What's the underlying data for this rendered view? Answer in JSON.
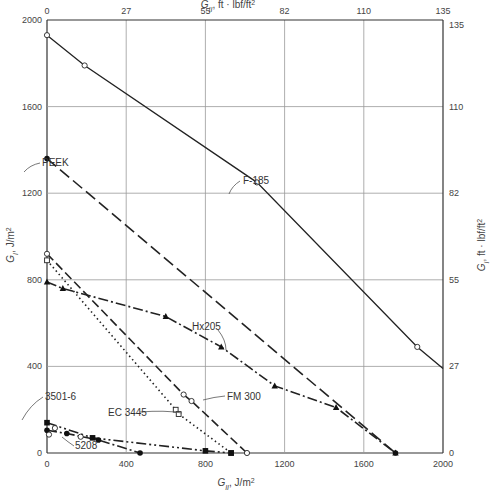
{
  "chart_data": {
    "type": "line",
    "title": "",
    "xlabel": "G_II, J/m²",
    "ylabel": "G_I, J/m²",
    "x2label": "G_II, ft · lbf/ft²",
    "y2label": "G_I, ft · lbf/ft²",
    "xlim": [
      0,
      2000
    ],
    "ylim": [
      0,
      2000
    ],
    "x_ticks": [
      "0",
      "400",
      "800",
      "1200",
      "1600",
      "2000"
    ],
    "y_ticks": [
      "0",
      "400",
      "800",
      "1200",
      "1600",
      "2000"
    ],
    "x2_ticks": [
      "0",
      "27",
      "55",
      "82",
      "110",
      "135"
    ],
    "y2_ticks": [
      "0",
      "27",
      "55",
      "82",
      "110",
      "135"
    ],
    "grid": true,
    "legend_position": "inline annotations",
    "series": [
      {
        "name": "F-185",
        "style": "solid",
        "marker": "open-circle",
        "x": [
          0,
          190,
          1060,
          1870,
          2000
        ],
        "y": [
          1930,
          1790,
          1250,
          490,
          390
        ]
      },
      {
        "name": "PEEK",
        "style": "dashed",
        "marker": "filled-circle",
        "x": [
          0,
          1760
        ],
        "y": [
          1360,
          0
        ]
      },
      {
        "name": "Hx205",
        "style": "dash-dot",
        "marker": "filled-triangle",
        "x": [
          0,
          80,
          600,
          880,
          1150,
          1460,
          1760
        ],
        "y": [
          790,
          760,
          630,
          490,
          310,
          210,
          0
        ]
      },
      {
        "name": "FM 300",
        "style": "long-dash",
        "marker": "open-circle",
        "x": [
          0,
          690,
          730,
          1010
        ],
        "y": [
          920,
          270,
          240,
          0
        ]
      },
      {
        "name": "EC 3445",
        "style": "dotted",
        "marker": "open-square",
        "x": [
          0,
          650,
          665,
          930
        ],
        "y": [
          890,
          200,
          180,
          0
        ]
      },
      {
        "name": "3501-6",
        "style": "dash-dot-dot",
        "marker": "filled-square",
        "x": [
          0,
          230,
          800,
          930
        ],
        "y": [
          140,
          70,
          10,
          0
        ]
      },
      {
        "name": "5208",
        "style": "dash-dot",
        "marker": "filled-circle",
        "x": [
          0,
          100,
          260,
          470
        ],
        "y": [
          105,
          90,
          60,
          0
        ]
      },
      {
        "name": "5208 data",
        "style": "none",
        "marker": "open-circle",
        "x": [
          10,
          40,
          170
        ],
        "y": [
          85,
          115,
          75
        ]
      }
    ],
    "annotations": [
      "PEEK",
      "F-185",
      "Hx205",
      "FM 300",
      "EC 3445",
      "3501-6",
      "5208"
    ]
  },
  "axes": {
    "bottom_label": "G",
    "bottom_sub": "II",
    "bottom_unit": ", J/m",
    "top_label": "G",
    "top_sub": "II",
    "top_unit": ", ft · lbf/ft",
    "left_label": "G",
    "left_sub": "I",
    "left_unit": ", J/m",
    "right_label": "G",
    "right_sub": "I",
    "right_unit": ", ft · lbf/ft",
    "sq": "2"
  }
}
